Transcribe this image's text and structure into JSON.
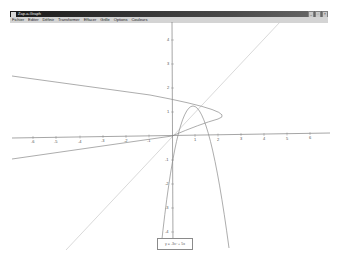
{
  "window": {
    "title": "Zap-a-Graph",
    "controls": {
      "minimize": "_",
      "maximize": "□",
      "close": "×"
    }
  },
  "menubar": {
    "items": [
      {
        "label": "Fichier"
      },
      {
        "label": "Editer"
      },
      {
        "label": "Définir"
      },
      {
        "label": "Transformer"
      },
      {
        "label": "Effacer"
      },
      {
        "label": "Grille"
      },
      {
        "label": "Options"
      },
      {
        "label": "Couleurs"
      }
    ]
  },
  "graph": {
    "origin_px": [
      172,
      136
    ],
    "unit_px": 23,
    "x_ticks": [
      "-6",
      "-5",
      "-4",
      "-3",
      "-2",
      "-1",
      "1",
      "2",
      "3",
      "4",
      "5",
      "6"
    ],
    "y_ticks": [
      "4",
      "3",
      "2",
      "1",
      "-1",
      "-2",
      "-3",
      "-4"
    ],
    "curves": [
      {
        "name": "parabola",
        "equation": "y = -3x² + 5x",
        "color": "#8a8a8a"
      },
      {
        "name": "inverse-parabola",
        "equation": "x = -3y² + 5y",
        "color": "#8a8a8a"
      },
      {
        "name": "identity-line",
        "equation": "y = x",
        "color": "#c8c8c8"
      }
    ],
    "legend": "y = -3x² + 5x"
  },
  "colors": {
    "titlebar": "#1a1a1a",
    "menubar": "#d4d4d4",
    "axis": "#666666",
    "curve": "#8a8a8a",
    "mirror_line": "#c8c8c8"
  }
}
